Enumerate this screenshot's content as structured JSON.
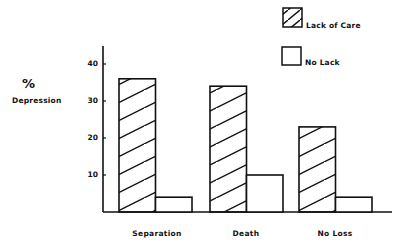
{
  "chart_data": {
    "type": "bar",
    "title": "",
    "xlabel": "",
    "ylabel": "% Depression",
    "ylabel_symbol": "%",
    "ylabel_text": "Depression",
    "ylim": [
      0,
      45
    ],
    "yticks": [
      10,
      20,
      30,
      40
    ],
    "grid": false,
    "legend_position": "top-right",
    "categories": [
      "Separation",
      "Death",
      "No Loss"
    ],
    "series": [
      {
        "name": "Lack of Care",
        "pattern": "hatched",
        "values": [
          36,
          34,
          23
        ]
      },
      {
        "name": "No Lack",
        "pattern": "empty",
        "values": [
          4,
          10,
          4
        ]
      }
    ]
  },
  "axis": {
    "y_symbol": "%",
    "y_text": "Depression",
    "ticks": [
      "10",
      "20",
      "30",
      "40"
    ]
  },
  "legend": {
    "items": [
      {
        "label": "Lack of Care"
      },
      {
        "label": "No Lack"
      }
    ]
  },
  "categories": [
    "Separation",
    "Death",
    "No Loss"
  ]
}
